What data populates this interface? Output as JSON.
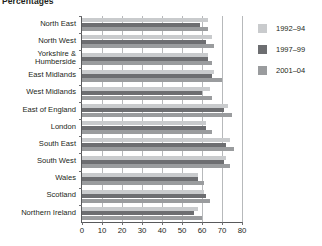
{
  "title": "Percentages",
  "legend": {
    "position": "right",
    "entries": [
      {
        "label": "1992–94",
        "color": "#c9cbcd"
      },
      {
        "label": "1997–99",
        "color": "#6d6e71"
      },
      {
        "label": "2001–04",
        "color": "#9a9c9e"
      }
    ]
  },
  "axis": {
    "ticks": [
      "0",
      "10",
      "20",
      "30",
      "40",
      "50",
      "60",
      "70",
      "80"
    ],
    "min": 0,
    "max": 80,
    "step": 10
  },
  "chart_data": {
    "type": "bar",
    "orientation": "horizontal",
    "title": "Percentages",
    "xlabel": "",
    "ylabel": "",
    "xlim": [
      0,
      80
    ],
    "grid": true,
    "legend_position": "right",
    "categories": [
      "North East",
      "North West",
      "Yorkshire &\nHumberside",
      "East Midlands",
      "West Midlands",
      "East of England",
      "London",
      "South East",
      "South West",
      "Wales",
      "Scotland",
      "Northern Ireland"
    ],
    "series": [
      {
        "name": "1992–94",
        "color": "#c9cbcd",
        "values": [
          63,
          65,
          63,
          66,
          64,
          73,
          62,
          74,
          72,
          58,
          61,
          58
        ]
      },
      {
        "name": "1997–99",
        "color": "#6d6e71",
        "values": [
          59,
          62,
          63,
          65,
          60,
          71,
          62,
          72,
          71,
          58,
          62,
          56
        ]
      },
      {
        "name": "2001–04",
        "color": "#9a9c9e",
        "values": [
          63,
          66,
          65,
          70,
          65,
          75,
          65,
          76,
          74,
          61,
          64,
          60
        ]
      }
    ]
  }
}
